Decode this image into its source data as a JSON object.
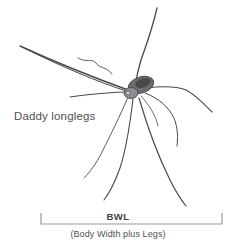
{
  "figure": {
    "background_color": "#ffffff",
    "width": 236,
    "height": 247,
    "line_color": "#4a4a4d",
    "text_color": "#4f4f52"
  },
  "species_label": {
    "text": "Daddy longlegs"
  },
  "measurement": {
    "abbreviation": "BWL",
    "caption": "(Body Width plus Legs)",
    "bracket": {
      "left_x": 41,
      "right_x": 222,
      "baseline_y": 224,
      "tick_height": 11,
      "color": "#9a9a9d"
    }
  },
  "illustration": {
    "subject": "daddy-longlegs-harvestman",
    "body_center": {
      "x": 137,
      "y": 89
    },
    "leg_count": 8
  }
}
